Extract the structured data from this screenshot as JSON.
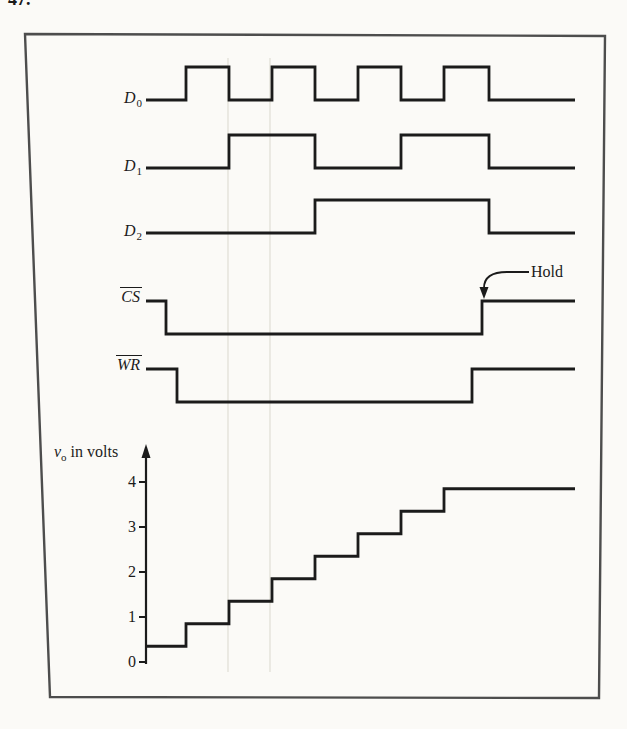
{
  "problem_number": "47.",
  "colors": {
    "ink": "#1b1b1b",
    "frame": "#4d4d4d",
    "paper": "#fbfaf7",
    "scan_streak": "#e7e5dd"
  },
  "figure": {
    "signals": [
      {
        "id": "D0",
        "label": {
          "base": "D",
          "sub": "0",
          "overline": false
        },
        "initial": "low",
        "start_x": 146,
        "end_x": 575,
        "edges_x": [
          186,
          229,
          272,
          315,
          358,
          401,
          444,
          489
        ]
      },
      {
        "id": "D1",
        "label": {
          "base": "D",
          "sub": "1",
          "overline": false
        },
        "initial": "low",
        "start_x": 146,
        "end_x": 575,
        "edges_x": [
          229,
          315,
          401,
          489
        ]
      },
      {
        "id": "D2",
        "label": {
          "base": "D",
          "sub": "2",
          "overline": false
        },
        "initial": "low",
        "start_x": 146,
        "end_x": 575,
        "edges_x": [
          315,
          489
        ]
      },
      {
        "id": "CS",
        "label": {
          "base": "CS",
          "sub": "",
          "overline": true
        },
        "initial": "high",
        "start_x": 146,
        "end_x": 575,
        "edges_x": [
          166,
          482
        ]
      },
      {
        "id": "WR",
        "label": {
          "base": "WR",
          "sub": "",
          "overline": true
        },
        "initial": "high",
        "start_x": 146,
        "end_x": 575,
        "edges_x": [
          177,
          472
        ]
      }
    ],
    "hold_annotation": {
      "text": "Hold",
      "points_to": "CS rising edge",
      "arrow_tip_x": 483
    },
    "vo_label": {
      "variable": "v",
      "subscript": "o",
      "rest": " in volts"
    },
    "chart_data": {
      "type": "line",
      "style": "staircase",
      "title": "v_o in volts",
      "ylabel": "v_o in volts",
      "yticks": [
        0,
        1,
        2,
        3,
        4
      ],
      "ylim": [
        0,
        4.4
      ],
      "grid": false,
      "steps": [
        {
          "x_from": 146,
          "x_to": 186,
          "volts": 0.35
        },
        {
          "x_from": 186,
          "x_to": 229,
          "volts": 0.85
        },
        {
          "x_from": 229,
          "x_to": 272,
          "volts": 1.35
        },
        {
          "x_from": 272,
          "x_to": 315,
          "volts": 1.85
        },
        {
          "x_from": 315,
          "x_to": 358,
          "volts": 2.35
        },
        {
          "x_from": 358,
          "x_to": 401,
          "volts": 2.85
        },
        {
          "x_from": 401,
          "x_to": 444,
          "volts": 3.35
        },
        {
          "x_from": 444,
          "x_to": 575,
          "volts": 3.85
        }
      ]
    }
  }
}
